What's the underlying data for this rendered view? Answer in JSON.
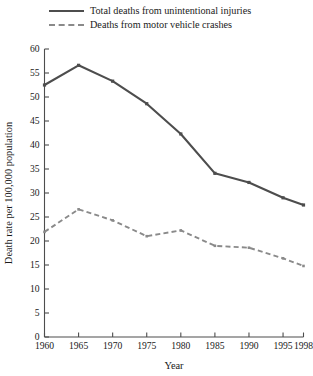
{
  "legend": {
    "position": "above-plot",
    "entries": [
      {
        "label": "Total deaths from unintentional injuries",
        "style": "solid",
        "color": "#4d4d4d"
      },
      {
        "label": "Deaths from motor vehicle crashes",
        "style": "dashed",
        "color": "#8a8a8a"
      }
    ]
  },
  "chart_data": {
    "type": "line",
    "title": "",
    "subtitle": "",
    "xlabel": "Year",
    "ylabel": "Death rate per 100,000 population",
    "x": [
      1960,
      1965,
      1970,
      1975,
      1980,
      1985,
      1990,
      1995,
      1998
    ],
    "categories": [
      "1960",
      "1965",
      "1970",
      "1975",
      "1980",
      "1985",
      "1990",
      "1995",
      "1998"
    ],
    "series": [
      {
        "name": "Total deaths from unintentional injuries",
        "style": "solid",
        "color": "#4d4d4d",
        "values": [
          52.5,
          56.6,
          53.3,
          48.6,
          42.3,
          34.1,
          32.2,
          29.0,
          27.5
        ]
      },
      {
        "name": "Deaths from motor vehicle crashes",
        "style": "dashed",
        "color": "#8a8a8a",
        "values": [
          21.9,
          26.6,
          24.3,
          21.0,
          22.2,
          19.0,
          18.6,
          16.4,
          14.8
        ]
      }
    ],
    "ylim": [
      0,
      60
    ],
    "yticks": [
      0,
      5,
      10,
      15,
      20,
      25,
      30,
      35,
      40,
      45,
      50,
      55,
      60
    ],
    "ytick_labels": [
      "0",
      "5",
      "10",
      "15",
      "20",
      "25",
      "30",
      "35",
      "40",
      "45",
      "50",
      "55",
      "60"
    ],
    "xtick_labels": [
      "1960",
      "1965",
      "1970",
      "1975",
      "1980",
      "1985",
      "1990",
      "1995",
      "1998"
    ],
    "grid": false,
    "legend_position": "top-left-above-axes",
    "axis_color": "#4d4d4d",
    "tick_direction": "in"
  }
}
